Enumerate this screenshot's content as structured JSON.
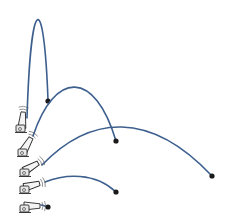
{
  "diagram": {
    "description": "Projectile trajectories fired from a cannon at five different launch angles",
    "colors": {
      "trajectory": "#3d5f8e",
      "projectile": "#1a1a1a",
      "cannon_outline": "#2a2a2a",
      "background": "#ffffff"
    },
    "launches": [
      {
        "id": "launch-1",
        "angle_deg": 85,
        "cannon": {
          "x": 22,
          "y": 126,
          "angle": -85
        },
        "path": "M 27 118 C 31 -10, 44 -10, 48 100",
        "landing": {
          "x": 48,
          "y": 101
        }
      },
      {
        "id": "launch-2",
        "angle_deg": 60,
        "cannon": {
          "x": 24,
          "y": 150,
          "angle": -60
        },
        "path": "M 33 136 C 55 70, 95 70, 116 141",
        "landing": {
          "x": 116,
          "y": 141
        }
      },
      {
        "id": "launch-3",
        "angle_deg": 40,
        "cannon": {
          "x": 26,
          "y": 170,
          "angle": -30
        },
        "path": "M 42 165 C 90 115, 150 110, 212 176",
        "landing": {
          "x": 212,
          "y": 176
        }
      },
      {
        "id": "launch-4",
        "angle_deg": 20,
        "cannon": {
          "x": 26,
          "y": 187,
          "angle": -15
        },
        "path": "M 45 182 C 65 174, 95 172, 116 192",
        "landing": {
          "x": 116,
          "y": 192
        }
      },
      {
        "id": "launch-5",
        "angle_deg": 0,
        "cannon": {
          "x": 26,
          "y": 206,
          "angle": 0
        },
        "path": "M 41 205 C 43 205, 45 206, 47 207",
        "landing": {
          "x": 48,
          "y": 207
        }
      }
    ]
  }
}
